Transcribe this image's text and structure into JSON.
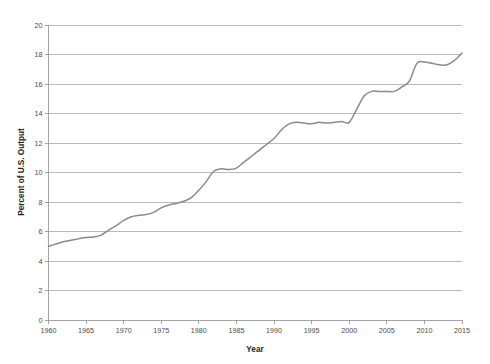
{
  "chart_data": {
    "type": "line",
    "title": "",
    "xlabel": "Year",
    "ylabel": "Percent of U.S. Output",
    "xlim": [
      1960,
      2015
    ],
    "ylim": [
      0,
      20
    ],
    "grid": true,
    "legend": "none",
    "line_color": "#8a8a8a",
    "gridline_color": "#adadad",
    "axis_color": "#9a9a9a",
    "background_color": "#ffffff",
    "x_ticks": [
      1960,
      1965,
      1970,
      1975,
      1980,
      1985,
      1990,
      1995,
      2000,
      2005,
      2010,
      2015
    ],
    "x_tick_labels": [
      "1960",
      "1965",
      "1970",
      "1975",
      "1980",
      "1985",
      "1990",
      "1995",
      "2000",
      "2005",
      "2010",
      "2015"
    ],
    "y_ticks": [
      0,
      2,
      4,
      6,
      8,
      10,
      12,
      14,
      16,
      18,
      20
    ],
    "y_tick_labels": [
      "0",
      "2",
      "4",
      "6",
      "8",
      "10",
      "12",
      "14",
      "16",
      "18",
      "20"
    ],
    "series": [
      {
        "name": "Percent of U.S. Output",
        "x": [
          1960,
          1961,
          1962,
          1963,
          1964,
          1965,
          1966,
          1967,
          1968,
          1969,
          1970,
          1971,
          1972,
          1973,
          1974,
          1975,
          1976,
          1977,
          1978,
          1979,
          1980,
          1981,
          1982,
          1983,
          1984,
          1985,
          1986,
          1987,
          1988,
          1989,
          1990,
          1991,
          1992,
          1993,
          1994,
          1995,
          1996,
          1997,
          1998,
          1999,
          2000,
          2001,
          2002,
          2003,
          2004,
          2005,
          2006,
          2007,
          2008,
          2009,
          2010,
          2011,
          2012,
          2013,
          2014,
          2015
        ],
        "values": [
          5.0,
          5.15,
          5.3,
          5.4,
          5.5,
          5.6,
          5.62,
          5.75,
          6.1,
          6.4,
          6.75,
          7.0,
          7.1,
          7.15,
          7.3,
          7.6,
          7.8,
          7.9,
          8.05,
          8.3,
          8.8,
          9.4,
          10.1,
          10.25,
          10.2,
          10.3,
          10.7,
          11.1,
          11.5,
          11.9,
          12.3,
          12.9,
          13.3,
          13.4,
          13.35,
          13.3,
          13.4,
          13.35,
          13.4,
          13.45,
          13.4,
          14.3,
          15.2,
          15.5,
          15.5,
          15.5,
          15.5,
          15.8,
          16.2,
          17.4,
          17.5,
          17.4,
          17.3,
          17.3,
          17.6,
          18.1
        ]
      }
    ]
  },
  "axis_titles": {
    "x": "Year",
    "y": "Percent of U.S. Output"
  }
}
